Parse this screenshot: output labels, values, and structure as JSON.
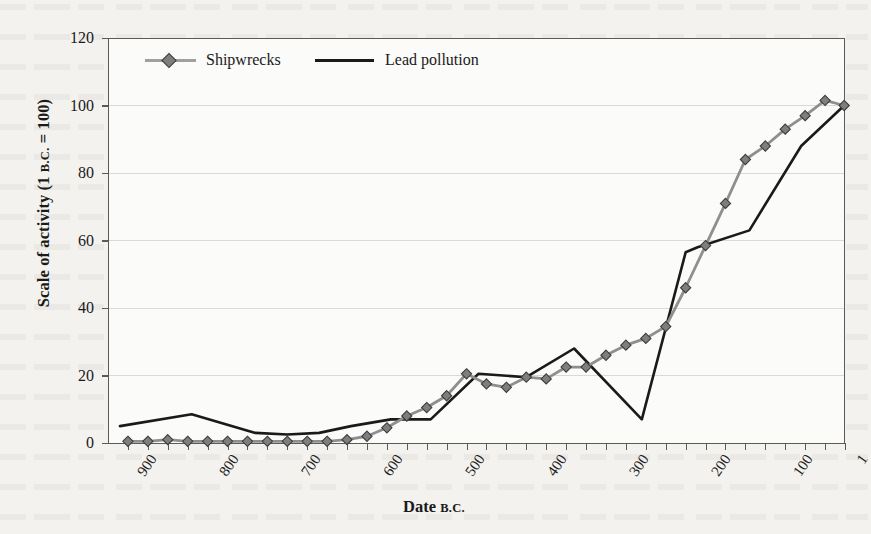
{
  "axes": {
    "y_title_main": "Scale of activity (1 ",
    "y_title_sc": "B.C.",
    "y_title_tail": " = 100)",
    "x_title_main": "Date ",
    "x_title_sc": "B.C.",
    "y_ticks": [
      "120",
      "100",
      "80",
      "60",
      "40",
      "20",
      "0"
    ],
    "x_ticks": [
      "900",
      "800",
      "700",
      "600",
      "500",
      "400",
      "300",
      "200",
      "100",
      "1"
    ],
    "ylim": [
      0,
      120
    ],
    "xlim_bc": [
      925,
      0
    ]
  },
  "legend": {
    "position": "top-left-inside",
    "entries": [
      {
        "label": "Shipwrecks",
        "color": "#8f8f8f",
        "marker": "diamond"
      },
      {
        "label": "Lead pollution",
        "color": "#1a1a1a",
        "marker": "none"
      }
    ]
  },
  "colors": {
    "shipwrecks": "#8f8f8f",
    "shipwrecks_marker_fill": "#7e7e7e",
    "shipwrecks_marker_edge": "#3d3d3d",
    "lead": "#1a1a1a",
    "axis": "#5b5a57",
    "grid": "#d9d9d6",
    "page": "#f3f2ee",
    "plot_bg": "#fbfbf9"
  },
  "chart_data": {
    "type": "line",
    "title": "",
    "xlabel": "Date B.C.",
    "ylabel": "Scale of activity (1 B.C. = 100)",
    "xlim": [
      925,
      0
    ],
    "ylim": [
      0,
      120
    ],
    "x_axis_direction": "descending-bc",
    "grid": "horizontal",
    "legend_position": "top-left-inside",
    "series": [
      {
        "name": "Shipwrecks",
        "color": "#8f8f8f",
        "marker": "diamond",
        "x_bc": [
          900,
          875,
          850,
          825,
          800,
          775,
          750,
          725,
          700,
          675,
          650,
          625,
          600,
          575,
          550,
          525,
          500,
          475,
          450,
          425,
          400,
          375,
          350,
          325,
          300,
          275,
          250,
          225,
          200,
          175,
          150,
          125,
          100,
          75,
          50,
          25,
          1
        ],
        "values": [
          0.5,
          0.5,
          1.0,
          0.5,
          0.5,
          0.5,
          0.5,
          0.5,
          0.5,
          0.5,
          0.5,
          1.0,
          2.0,
          4.5,
          8.0,
          10.5,
          14.0,
          20.5,
          17.5,
          16.5,
          19.5,
          19.0,
          22.5,
          22.5,
          26.0,
          29.0,
          31.0,
          34.5,
          46.0,
          58.5,
          71.0,
          84.0,
          88.0,
          93.0,
          97.0,
          101.5,
          100.0
        ]
      },
      {
        "name": "Lead pollution",
        "color": "#1a1a1a",
        "marker": "none",
        "x_bc": [
          910,
          820,
          740,
          700,
          660,
          620,
          570,
          520,
          460,
          400,
          340,
          255,
          200,
          185,
          120,
          55,
          1
        ],
        "values": [
          5.0,
          8.5,
          3.0,
          2.5,
          3.0,
          5.0,
          7.0,
          7.0,
          20.5,
          19.5,
          28.0,
          7.0,
          56.5,
          58.0,
          63.0,
          88.0,
          100.0
        ]
      }
    ]
  }
}
